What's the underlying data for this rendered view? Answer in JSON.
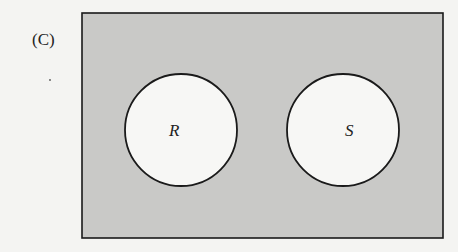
{
  "figure": {
    "part_label": "(C)",
    "sets": [
      {
        "name": "R",
        "cx": 181,
        "cy": 130,
        "r": 56
      },
      {
        "name": "S",
        "cx": 343,
        "cy": 130,
        "r": 56
      }
    ],
    "universe": {
      "x": 82,
      "y": 13,
      "width": 361,
      "height": 225
    },
    "colors": {
      "background": "#f4f4f2",
      "shade": "#c9c9c7",
      "unshaded": "#f7f7f5",
      "stroke": "#1a1a1a"
    },
    "shaded_regions": [
      "outside R and S",
      "R ∩ S"
    ]
  }
}
